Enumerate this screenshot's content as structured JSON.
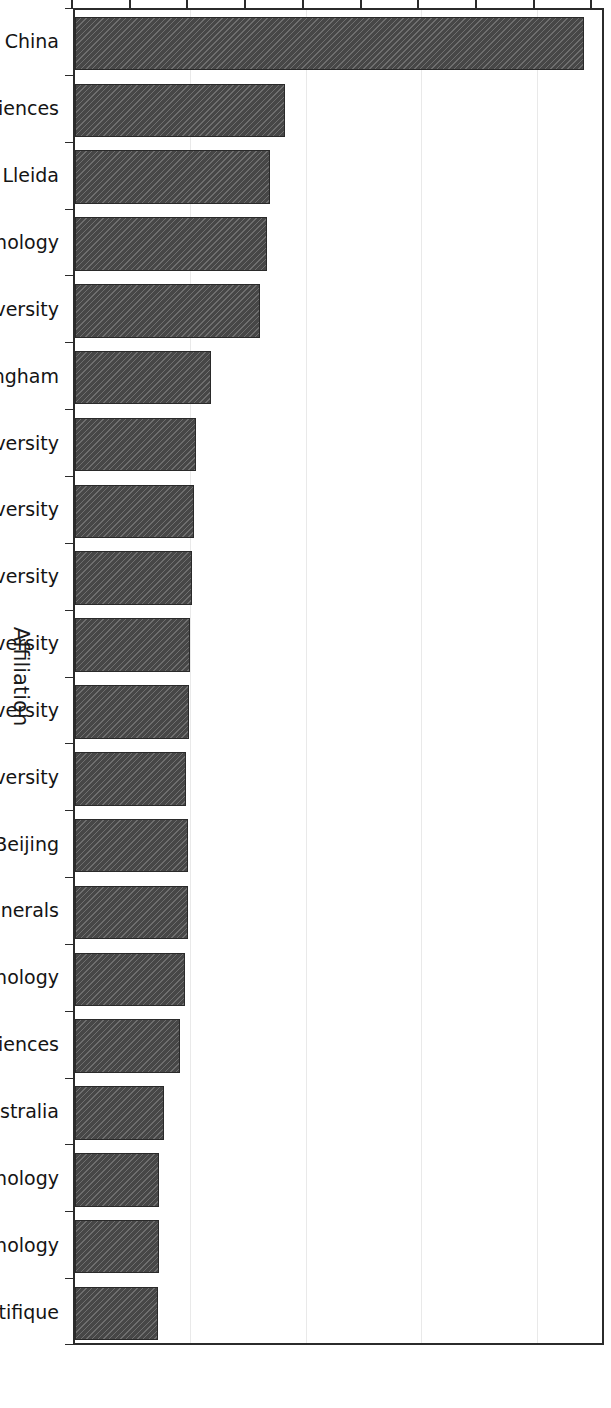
{
  "chart_data": {
    "type": "bar",
    "title": "",
    "orientation": "vertical-rotated",
    "xlabel": "Affiliation",
    "ylabel": "Number of publications",
    "ylim": [
      0,
      460
    ],
    "grid": true,
    "legend": "none",
    "y_ticks_major": [
      0,
      100,
      200,
      300,
      400
    ],
    "y_ticks_minor": [
      50,
      150,
      250,
      350,
      450
    ],
    "categories": [
      "Ministry of Education China",
      "Chinese Academy of Sciences",
      "Universitat de Lleida",
      "South China University of Technology",
      "Xi'an Jiaotong University",
      "University of Birmingham",
      "Tsinghua University",
      "Shanghai Jiao Tong University",
      "Anna University",
      "Sichuan University",
      "Tokat Gaziosmanpasa University",
      "Karadeniz Technical University",
      "University of Science and Technology Beijing",
      "King Fahd University of Petroleum and Minerals",
      "China University of Mining and Technology",
      "University of Chinese Academy of Sciences",
      "University of South Australia",
      "Harbin Institute of Technology",
      "Guangdong University of Technology",
      "CNRS Centre National de la Recherche Scientifique"
    ],
    "values": [
      441,
      182,
      169,
      166,
      160,
      118,
      105,
      103,
      101,
      100,
      99,
      96,
      98,
      98,
      95,
      91,
      77,
      73,
      73,
      72
    ],
    "bar_color": "#474747",
    "bar_edge_color": "#2a2a2a",
    "grid_color": "#e9e9e9",
    "axis_color": "#2b2b2b"
  },
  "axis": {
    "value_title": "Number of publications",
    "category_title": "Affiliation",
    "tick_labels": [
      "0",
      "100",
      "200",
      "300",
      "400"
    ]
  }
}
